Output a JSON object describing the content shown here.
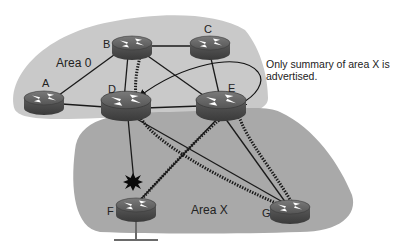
{
  "diagram": {
    "type": "OSPF area topology",
    "areas": [
      {
        "id": "area0",
        "label": "Area 0",
        "fill": "#c9c9c9"
      },
      {
        "id": "areaX",
        "label": "Area X",
        "fill": "#a9a9a9"
      }
    ],
    "routers": [
      {
        "id": "A",
        "label": "A",
        "area": "Area 0"
      },
      {
        "id": "B",
        "label": "B",
        "area": "Area 0"
      },
      {
        "id": "C",
        "label": "C",
        "area": "Area 0"
      },
      {
        "id": "D",
        "label": "D",
        "area": "Area 0 / Area X"
      },
      {
        "id": "E",
        "label": "E",
        "area": "Area 0 / Area X"
      },
      {
        "id": "F",
        "label": "F",
        "area": "Area X"
      },
      {
        "id": "G",
        "label": "G",
        "area": "Area X"
      }
    ],
    "links": [
      [
        "A",
        "B"
      ],
      [
        "A",
        "D"
      ],
      [
        "B",
        "C"
      ],
      [
        "B",
        "D"
      ],
      [
        "B",
        "E"
      ],
      [
        "C",
        "E"
      ],
      [
        "C",
        "D"
      ],
      [
        "D",
        "E"
      ],
      [
        "D",
        "F"
      ],
      [
        "D",
        "G"
      ],
      [
        "E",
        "F"
      ],
      [
        "E",
        "G"
      ]
    ],
    "dotted_paths": [
      {
        "from": "B",
        "via": "D",
        "to": "F",
        "description": "path down through D toward F"
      },
      {
        "from": "D",
        "to": "G"
      },
      {
        "from": "E",
        "to": "F"
      },
      {
        "from": "E",
        "to": "G"
      }
    ],
    "failure_marker": {
      "near": "F",
      "on_link": "D-F",
      "icon": "explosion-icon"
    },
    "annotation": {
      "line1": "Only summary of area X is",
      "line2": "advertised.",
      "arrows_to": [
        "D",
        "E"
      ]
    },
    "colors": {
      "router_body": "#4a4a4a",
      "router_top": "#6a6a6a",
      "line": "#1a1a1a",
      "background": "#ffffff"
    }
  }
}
